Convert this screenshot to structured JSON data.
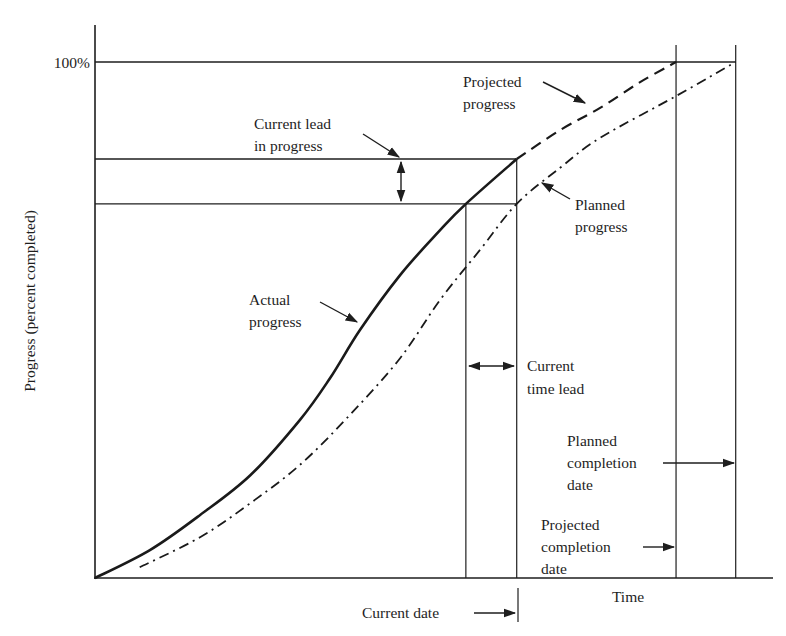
{
  "chart_data": {
    "type": "line",
    "title": "",
    "xlabel": "Time",
    "ylabel": "Progress (percent completed)",
    "y_tick_labels": [
      "100%"
    ],
    "xlim": [
      0,
      100
    ],
    "ylim": [
      0,
      100
    ],
    "grid": false,
    "series": [
      {
        "name": "Actual progress",
        "style": "solid",
        "x": [
          0,
          8.1,
          15.5,
          22.9,
          30.2,
          34.7,
          39.1,
          45.0,
          50.9,
          54.7,
          62.2
        ],
        "y": [
          0,
          5.4,
          12.2,
          19.9,
          30.6,
          38.8,
          48.1,
          58.7,
          67.4,
          72.5,
          81.2
        ]
      },
      {
        "name": "Projected progress",
        "style": "dashed",
        "x": [
          62.2,
          68.6,
          74.5,
          80.4,
          85.7
        ],
        "y": [
          81.2,
          86.8,
          91.1,
          96.1,
          100
        ]
      },
      {
        "name": "Planned progress",
        "style": "dash-dot",
        "x": [
          6.6,
          15.5,
          22.9,
          30.2,
          37.6,
          45.0,
          50.9,
          56.8,
          62.2,
          68.6,
          74.5,
          85.7,
          94.5
        ],
        "y": [
          2.1,
          7.9,
          14.5,
          21.9,
          31.6,
          42.6,
          53.9,
          63.6,
          72.5,
          79.5,
          85.3,
          93.4,
          100
        ]
      }
    ],
    "reference_lines": {
      "current_date_t": 62.2,
      "actual_reaches_planned_level_t": 54.7,
      "projected_completion_t": 85.7,
      "planned_completion_t": 94.5,
      "actual_progress_at_current_date": 81.2,
      "planned_progress_at_current_date": 72.5
    },
    "annotations": {
      "projected_progress": [
        "Projected",
        "progress"
      ],
      "planned_progress": [
        "Planned",
        "progress"
      ],
      "actual_progress": [
        "Actual",
        "progress"
      ],
      "current_lead_in_progress": [
        "Current lead",
        "in progress"
      ],
      "current_time_lead": [
        "Current",
        "time lead"
      ],
      "planned_completion_date": [
        "Planned",
        "completion",
        "date"
      ],
      "projected_completion_date": [
        "Projected",
        "completion",
        "date"
      ],
      "current_date": "Current date"
    }
  }
}
